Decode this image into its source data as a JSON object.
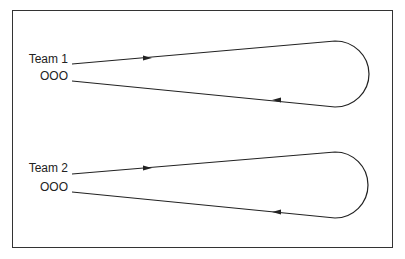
{
  "diagram": {
    "teams": [
      {
        "name": "Team 1",
        "players": "OOO"
      },
      {
        "name": "Team 2",
        "players": "OOO"
      }
    ],
    "colors": {
      "line": "#222222",
      "border": "#333333",
      "background": "#ffffff"
    }
  }
}
